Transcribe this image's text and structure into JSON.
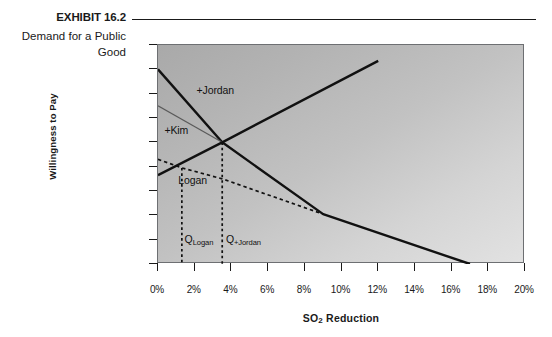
{
  "caption": {
    "exhibit_number": "EXHIBIT 16.2",
    "exhibit_title": "Demand for a Public Good"
  },
  "chart_data": {
    "type": "line",
    "title": "Demand for a Public Good",
    "xlabel": "SO₂ Reduction",
    "ylabel": "Willingness to Pay",
    "xlim": [
      0,
      20
    ],
    "ylim": [
      0,
      9
    ],
    "grid": false,
    "legend": "none",
    "x_ticks": [
      "0%",
      "2%",
      "4%",
      "6%",
      "8%",
      "10%",
      "12%",
      "14%",
      "16%",
      "18%",
      "20%"
    ],
    "x_tick_values": [
      0,
      2,
      4,
      6,
      8,
      10,
      12,
      14,
      16,
      18,
      20
    ],
    "y_ticks": [
      "$0",
      "$1",
      "$2",
      "$3",
      "$4",
      "$5",
      "$6",
      "$7",
      "$8",
      "$9"
    ],
    "y_tick_values": [
      0,
      1,
      2,
      3,
      4,
      5,
      6,
      7,
      8,
      9
    ],
    "series": [
      {
        "name": "+Jordan",
        "style": "solid-thick",
        "color": "#111111",
        "points": [
          [
            0,
            8.0
          ],
          [
            3.5,
            5.0
          ],
          [
            9.0,
            2.05
          ],
          [
            17.0,
            0.0
          ]
        ]
      },
      {
        "name": "+Kim",
        "style": "solid-thin",
        "color": "#5a5a5a",
        "points": [
          [
            0,
            6.5
          ],
          [
            3.5,
            5.0
          ]
        ]
      },
      {
        "name": "Marginal cost / supply",
        "style": "solid-thick",
        "color": "#111111",
        "points": [
          [
            0,
            3.65
          ],
          [
            3.5,
            5.0
          ],
          [
            12.0,
            8.35
          ]
        ]
      },
      {
        "name": "Logan",
        "style": "dashed",
        "color": "#111111",
        "points": [
          [
            0,
            4.3
          ],
          [
            1.3,
            3.95
          ],
          [
            3.5,
            3.5
          ],
          [
            9.0,
            2.05
          ]
        ]
      }
    ],
    "annotations": [
      {
        "text": "+Jordan",
        "x": 2.1,
        "y": 7.1
      },
      {
        "text": "+Kim",
        "x": 0.35,
        "y": 5.45
      },
      {
        "text": "Logan",
        "x": 1.1,
        "y": 3.42
      },
      {
        "text": "Q_Logan",
        "x": 1.45,
        "y": 1.0,
        "base": "Q",
        "sub": "Logan"
      },
      {
        "text": "Q_+Jordan",
        "x": 3.7,
        "y": 1.0,
        "base": "Q",
        "sub": "+Jordan"
      }
    ],
    "dropline_values": [
      {
        "label": "Q_Logan",
        "x": 1.3,
        "from_y": 3.95,
        "to_y": 0
      },
      {
        "label": "Q_+Jordan",
        "x": 3.5,
        "from_y": 5.0,
        "to_y": 0
      }
    ]
  }
}
